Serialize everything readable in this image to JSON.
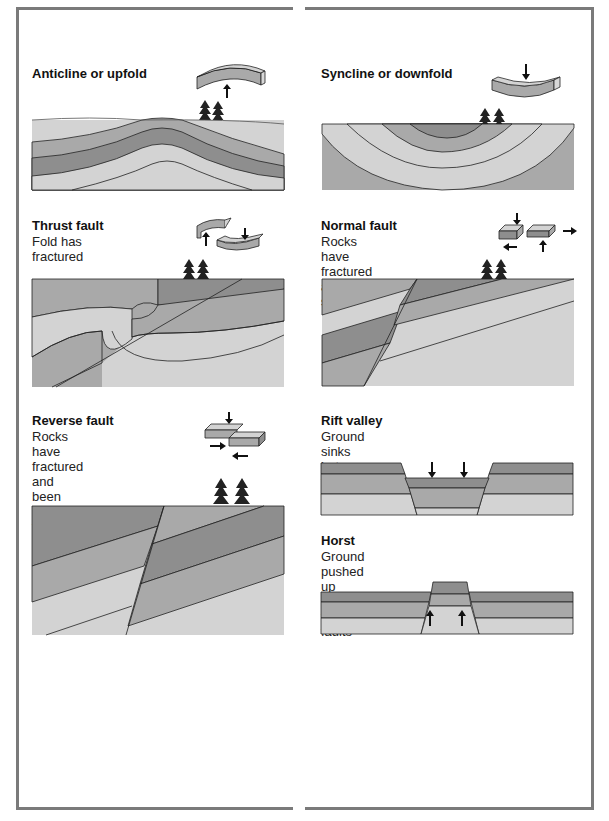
{
  "colors": {
    "light": "#d3d3d3",
    "mid": "#a9a9a9",
    "dark": "#8e8e8e",
    "darker": "#858585",
    "line": "#222222",
    "frame": "#7a7a7a"
  },
  "panels": {
    "anticline": {
      "title": "Anticline or upfold",
      "desc": []
    },
    "syncline": {
      "title": "Syncline or downfold",
      "desc": []
    },
    "thrust": {
      "title": "Thrust fault",
      "desc": [
        "Fold has",
        "fractured"
      ]
    },
    "normal": {
      "title": "Normal fault",
      "desc": [
        "Rocks have",
        "fractured and",
        "stretched"
      ]
    },
    "reverse": {
      "title": "Reverse fault",
      "desc": [
        "Rocks have",
        "fractured and",
        "been pushed",
        "together"
      ]
    },
    "rift": {
      "title": "Rift valley",
      "desc": [
        "Ground sinks",
        "between two faults"
      ]
    },
    "horst": {
      "title": "Horst",
      "desc": [
        "Ground pushed up",
        "between two faults"
      ]
    }
  }
}
